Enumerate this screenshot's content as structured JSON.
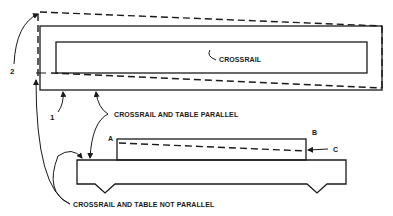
{
  "diagram": {
    "labels": {
      "crossrail": "CROSSRAIL",
      "parallel": "CROSSRAIL AND TABLE PARALLEL",
      "not_parallel": "CROSSRAIL AND TABLE NOT PARALLEL",
      "ref_1": "1",
      "ref_2": "2",
      "point_a": "A",
      "point_b": "B",
      "point_c": "C"
    }
  }
}
